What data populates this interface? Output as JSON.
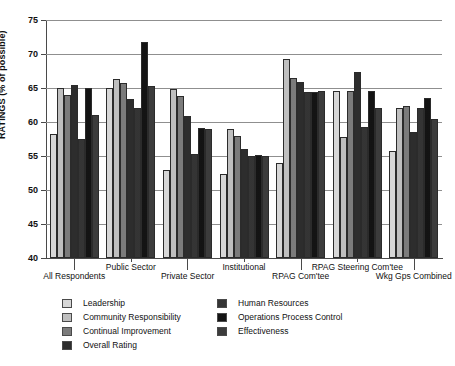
{
  "chart_data": {
    "type": "bar",
    "title": "",
    "xlabel": "",
    "ylabel": "RATINGS (% of possible)",
    "ylim": [
      40,
      75
    ],
    "ytick_step": 5,
    "yticks": [
      40,
      45,
      50,
      55,
      60,
      65,
      70,
      75
    ],
    "grid": true,
    "legend_position": "below-plot",
    "categories": [
      "All Respondents",
      "Public Sector",
      "Private Sector",
      "Institutional",
      "RPAG Com'tee",
      "RPAG Steering Com'tee",
      "Wkg Gps Combined"
    ],
    "series": [
      {
        "name": "Leadership",
        "pattern": "p1",
        "values": [
          58.3,
          65.0,
          53.0,
          52.3,
          54.0,
          64.5,
          55.8
        ]
      },
      {
        "name": "Community Responsibility",
        "pattern": "p2",
        "values": [
          65.0,
          66.3,
          64.8,
          58.9,
          69.2,
          57.8,
          62.0
        ]
      },
      {
        "name": "Continual Improvement",
        "pattern": "p3",
        "values": [
          64.0,
          65.7,
          63.8,
          57.9,
          66.5,
          64.5,
          62.3
        ]
      },
      {
        "name": "Overall Rating",
        "pattern": "p4",
        "values": [
          65.5,
          63.4,
          60.9,
          56.0,
          65.9,
          67.3,
          58.5
        ]
      },
      {
        "name": "Human Resources",
        "pattern": "p5",
        "values": [
          57.5,
          62.0,
          55.3,
          55.0,
          64.4,
          59.3,
          62.0
        ]
      },
      {
        "name": "Operations Process Control",
        "pattern": "p6",
        "values": [
          65.0,
          71.7,
          59.1,
          55.1,
          64.4,
          64.5,
          63.5
        ]
      },
      {
        "name": "Effectiveness",
        "pattern": "p7",
        "values": [
          61.0,
          65.3,
          58.9,
          55.0,
          64.5,
          62.0,
          60.5
        ]
      }
    ]
  },
  "legend": {
    "column_left": [
      {
        "label": "Leadership",
        "pattern": "p1"
      },
      {
        "label": "Community Responsibility",
        "pattern": "p2"
      },
      {
        "label": "Continual Improvement",
        "pattern": "p3"
      },
      {
        "label": "Overall Rating",
        "pattern": "p4"
      }
    ],
    "column_right": [
      {
        "label": "Human Resources",
        "pattern": "p5"
      },
      {
        "label": "Operations Process Control",
        "pattern": "p6"
      },
      {
        "label": "Effectiveness",
        "pattern": "p7"
      }
    ]
  },
  "axis": {
    "y_title": "RATINGS (% of possible)",
    "y_labels": [
      "75",
      "70",
      "65",
      "60",
      "55",
      "50",
      "45",
      "40"
    ]
  },
  "colors": {
    "background": "#ffffff",
    "axis": "#4a4a4a",
    "grid": "#8f8f8f",
    "text": "#111111",
    "bar_outline": "#2b2b2b"
  }
}
